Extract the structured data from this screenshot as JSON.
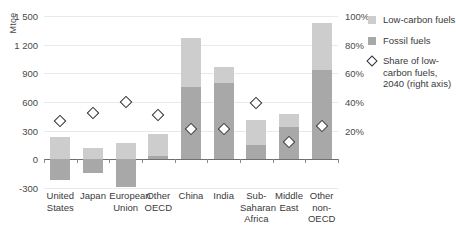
{
  "chart_data": {
    "type": "bar",
    "title": "",
    "subtitle": "",
    "xlabel": "",
    "ylabel": "Mtoe",
    "y2label": "",
    "stacked": true,
    "grid": true,
    "legend_position": "right",
    "categories": [
      "United States",
      "Japan",
      "European Union",
      "Other OECD",
      "China",
      "India",
      "Sub-Saharan Africa",
      "Middle East",
      "Other non-OECD"
    ],
    "ylim": [
      -300,
      1500
    ],
    "yticks": [
      1500,
      1200,
      900,
      600,
      300,
      0,
      -300
    ],
    "ytick_labels": [
      "1 500",
      "1 200",
      "900",
      "600",
      "300",
      "0",
      "-300"
    ],
    "y2lim": [
      0,
      100
    ],
    "y2ticks": [
      100,
      80,
      60,
      40,
      20
    ],
    "y2tick_labels": [
      "100%",
      "80%",
      "60%",
      "40%",
      "20%"
    ],
    "series": [
      {
        "name": "Low-carbon fuels",
        "color": "#cdcdcd",
        "values": [
          230,
          115,
          170,
          235,
          520,
          170,
          265,
          130,
          490
        ]
      },
      {
        "name": "Fossil fuels",
        "color": "#a8a8a8",
        "values": [
          -215,
          -145,
          -290,
          30,
          755,
          795,
          145,
          340,
          935
        ]
      }
    ],
    "marker_series": {
      "name": "Share of low-carbon fuels, 2040 (right axis)",
      "marker": "diamond",
      "axis": "right",
      "unit": "%",
      "values": [
        27,
        32,
        40,
        31,
        21,
        21,
        39,
        12,
        23
      ]
    }
  },
  "legend": {
    "items": [
      {
        "icon": "square-swatch",
        "label": "Low-carbon fuels",
        "kind": "low"
      },
      {
        "icon": "square-swatch",
        "label": "Fossil fuels",
        "kind": "fos"
      },
      {
        "icon": "diamond-marker",
        "label": "Share of low-carbon fuels, 2040 (right axis)",
        "kind": "dia"
      }
    ]
  },
  "colors": {
    "low_carbon": "#cdcdcd",
    "fossil": "#a8a8a8",
    "gridline": "#e9e9e9",
    "axis": "#6f6f6f",
    "text": "#3a3a3a"
  }
}
